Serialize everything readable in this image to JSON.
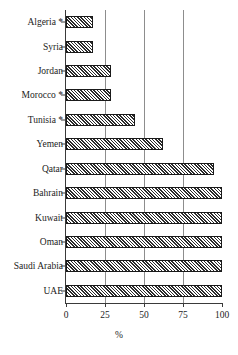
{
  "chart_data": {
    "type": "bar",
    "orientation": "horizontal",
    "title": "",
    "xlabel": "%",
    "ylabel": "",
    "xlim": [
      0,
      100
    ],
    "xticks": [
      0,
      25,
      50,
      75,
      100
    ],
    "xtick_labels": [
      "0",
      "25",
      "50",
      "75",
      "100"
    ],
    "grid": "vertical gridlines at 25, 50, 75",
    "legend": "none",
    "categories": [
      "Algeria *",
      "Syria",
      "Jordan",
      "Morocco *",
      "Tunisia *",
      "Yemen",
      "Qatar",
      "Bahrain",
      "Kuwait",
      "Oman",
      "Saudi Arabia",
      "UAE"
    ],
    "values": [
      17,
      17,
      29,
      29,
      44,
      62,
      95,
      100,
      100,
      100,
      100,
      100
    ]
  },
  "axis": {
    "x_title": "%"
  }
}
